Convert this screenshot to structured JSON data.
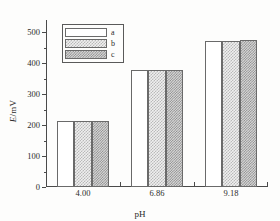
{
  "chart_data": {
    "type": "bar",
    "title": "",
    "subtitle": "",
    "xlabel": "pH",
    "ylabel": "E/mV",
    "categories": [
      "4.00",
      "6.86",
      "9.18"
    ],
    "series": [
      {
        "name": "a",
        "values": [
          212,
          377,
          473
        ],
        "pattern": "white",
        "fill": "#ffffff"
      },
      {
        "name": "b",
        "values": [
          212,
          377,
          473
        ],
        "pattern": "light-checkerboard",
        "fill": "#efefef"
      },
      {
        "name": "c",
        "values": [
          215,
          377,
          475
        ],
        "pattern": "dark-checkerboard",
        "fill": "#d8d8d8"
      }
    ],
    "ylim": [
      0,
      540
    ],
    "ytick_labels": [
      "0",
      "100",
      "200",
      "300",
      "400",
      "500"
    ],
    "ytick_values": [
      0,
      100,
      200,
      300,
      400,
      500
    ],
    "yminor_values": [
      50,
      150,
      250,
      350,
      450
    ],
    "xtick_labels": [
      "4.00",
      "6.86",
      "9.18"
    ],
    "grid": false,
    "legend_position": "upper-left-inside",
    "legend_entries": [
      "a",
      "b",
      "c"
    ],
    "axis_color": "#4a4a4a",
    "bar_edge_color": "#6a6a6a"
  },
  "axes": {
    "y_title_italic": "E",
    "y_title_rest": "/mV",
    "x_title": "pH"
  },
  "legend": {
    "rows": [
      {
        "label": "a"
      },
      {
        "label": "b"
      },
      {
        "label": "c"
      }
    ]
  }
}
